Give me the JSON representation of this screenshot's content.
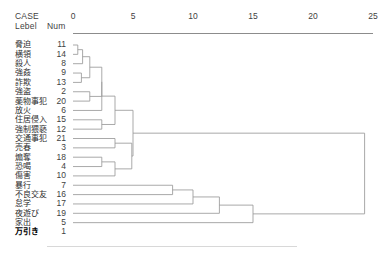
{
  "header": {
    "case": "CASE",
    "lebel": "Lebel",
    "num": "Num"
  },
  "axis": {
    "ticks": [
      "0",
      "5",
      "10",
      "15",
      "20",
      "25"
    ]
  },
  "caption": "",
  "chart_data": {
    "type": "dendrogram",
    "title": "",
    "xlabel": "",
    "ylabel": "",
    "xlim": [
      0,
      25
    ],
    "grid": false,
    "legend": "none",
    "axis_ticks": [
      0,
      5,
      10,
      15,
      20,
      25
    ],
    "leaves": [
      {
        "label": "脅迫",
        "num": "11"
      },
      {
        "label": "横領",
        "num": "14"
      },
      {
        "label": "殺人",
        "num": "8"
      },
      {
        "label": "強姦",
        "num": "9"
      },
      {
        "label": "詐欺",
        "num": "13"
      },
      {
        "label": "強盗",
        "num": "2"
      },
      {
        "label": "薬物事犯",
        "num": "20"
      },
      {
        "label": "放火",
        "num": "6"
      },
      {
        "label": "住居侵入",
        "num": "15"
      },
      {
        "label": "強制猥褻",
        "num": "12"
      },
      {
        "label": "交通事犯",
        "num": "21"
      },
      {
        "label": "売春",
        "num": "3"
      },
      {
        "label": "煽奪",
        "num": "18"
      },
      {
        "label": "恐喝",
        "num": "4"
      },
      {
        "label": "傷害",
        "num": "10"
      },
      {
        "label": "暴行",
        "num": "7"
      },
      {
        "label": "不良交友",
        "num": "16"
      },
      {
        "label": "怠学",
        "num": "17"
      },
      {
        "label": "夜遊び",
        "num": "19"
      },
      {
        "label": "家出",
        "num": "5"
      },
      {
        "label": "万引き",
        "num": "1",
        "bold": true
      }
    ],
    "merges": [
      {
        "children": [
          0,
          1
        ],
        "distance": 0.4
      },
      {
        "children": [
          21,
          2
        ],
        "distance": 0.8
      },
      {
        "children": [
          3,
          4
        ],
        "distance": 0.7
      },
      {
        "children": [
          22,
          23
        ],
        "distance": 1.4
      },
      {
        "children": [
          5,
          6
        ],
        "distance": 1.4
      },
      {
        "children": [
          24,
          25
        ],
        "distance": 2.4
      },
      {
        "children": [
          26,
          7
        ],
        "distance": 2.4
      },
      {
        "children": [
          8,
          9
        ],
        "distance": 2.4
      },
      {
        "children": [
          27,
          28
        ],
        "distance": 3.5
      },
      {
        "children": [
          10,
          11
        ],
        "distance": 3.5
      },
      {
        "children": [
          12,
          13
        ],
        "distance": 2.4
      },
      {
        "children": [
          31,
          14
        ],
        "distance": 3.5
      },
      {
        "children": [
          30,
          32
        ],
        "distance": 4.9
      },
      {
        "children": [
          29,
          33
        ],
        "distance": 5.0
      },
      {
        "children": [
          15,
          16
        ],
        "distance": 8.3
      },
      {
        "children": [
          35,
          17
        ],
        "distance": 10.0
      },
      {
        "children": [
          36,
          18
        ],
        "distance": 12.2
      },
      {
        "children": [
          37,
          19
        ],
        "distance": 15.0
      },
      {
        "children": [
          34,
          38
        ],
        "distance": 24.3
      }
    ]
  }
}
